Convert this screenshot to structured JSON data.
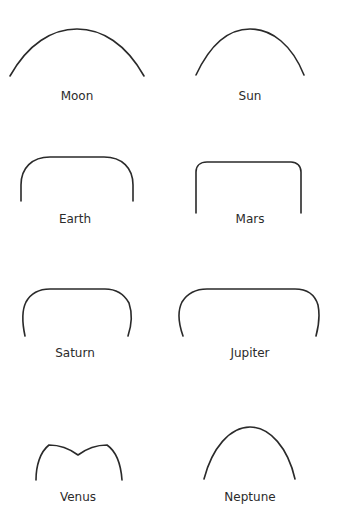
{
  "diagram": {
    "panels": [
      {
        "id": "moon",
        "label": "Moon",
        "shape": "wide-arc",
        "label_pos": [
          77,
          89
        ]
      },
      {
        "id": "sun",
        "label": "Sun",
        "shape": "arc",
        "label_pos": [
          250,
          89
        ]
      },
      {
        "id": "earth",
        "label": "Earth",
        "shape": "rounded-arch-large-corners",
        "label_pos": [
          75,
          212
        ]
      },
      {
        "id": "mars",
        "label": "Mars",
        "shape": "rounded-arch-small-corners",
        "label_pos": [
          250,
          212
        ]
      },
      {
        "id": "saturn",
        "label": "Saturn",
        "shape": "rounded-arch-inward-legs",
        "label_pos": [
          75,
          346
        ]
      },
      {
        "id": "jupiter",
        "label": "Jupiter",
        "shape": "wide-rounded-arch-inward-legs",
        "label_pos": [
          250,
          346
        ]
      },
      {
        "id": "venus",
        "label": "Venus",
        "shape": "double-peak-arch",
        "label_pos": [
          78,
          490
        ]
      },
      {
        "id": "neptune",
        "label": "Neptune",
        "shape": "tall-arc",
        "label_pos": [
          250,
          490
        ]
      }
    ],
    "stroke_color": "#2a2a2a",
    "background": "#ffffff"
  }
}
